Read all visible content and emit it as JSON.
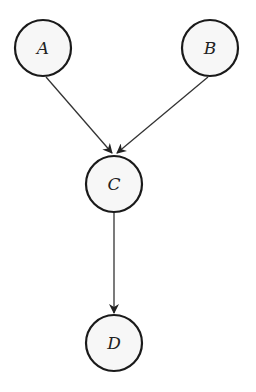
{
  "diagram": {
    "type": "directed-graph",
    "nodes": [
      {
        "id": "A",
        "label": "A",
        "cx": 43,
        "cy": 48
      },
      {
        "id": "B",
        "label": "B",
        "cx": 210,
        "cy": 48
      },
      {
        "id": "C",
        "label": "C",
        "cx": 114,
        "cy": 184
      },
      {
        "id": "D",
        "label": "D",
        "cx": 114,
        "cy": 343
      }
    ],
    "edges": [
      {
        "from": "A",
        "to": "C"
      },
      {
        "from": "B",
        "to": "C"
      },
      {
        "from": "C",
        "to": "D"
      }
    ],
    "colors": {
      "stroke": "#1a1a1a",
      "fill": "#f7f7f7",
      "edge": "#333333"
    }
  }
}
